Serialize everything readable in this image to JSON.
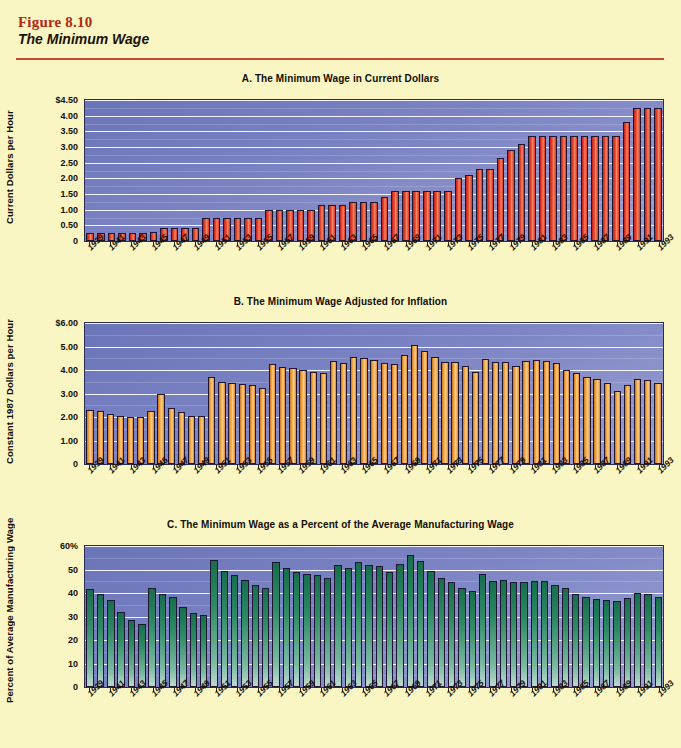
{
  "figure": {
    "number": "Figure 8.10",
    "title": "The Minimum Wage"
  },
  "colors": {
    "page_background": "#f9f6c4",
    "rule": "#c8482e",
    "figure_number": "#b02a14",
    "plot_background_top": "#6a74b8",
    "plot_background_bottom": "#9aa0d2",
    "bar_a": "#ea4a2b",
    "bar_b": "#f0a23f",
    "bar_c": "#2d8a63",
    "gridline": "#ffffff"
  },
  "panels": [
    {
      "key": "A",
      "title": "A.  The Minimum Wage in Current Dollars",
      "ylabel": "Current Dollars per Hour",
      "bar_class": "red",
      "yticks": [
        "$4.50",
        "4.00",
        "3.50",
        "3.00",
        "2.50",
        "2.00",
        "1.50",
        "1.00",
        "0.50",
        "0"
      ]
    },
    {
      "key": "B",
      "title": "B.  The Minimum Wage Adjusted for Inflation",
      "ylabel": "Constant 1987 Dollars per Hour",
      "bar_class": "orange",
      "yticks": [
        "$6.00",
        "5.00",
        "4.00",
        "3.00",
        "2.00",
        "1.00",
        "0"
      ]
    },
    {
      "key": "C",
      "title": "C.  The Minimum Wage as a Percent of the Average Manufacturing Wage",
      "ylabel": "Percent of Average Manufacturing Wage",
      "bar_class": "green",
      "yticks": [
        "60%",
        "50",
        "40",
        "30",
        "20",
        "10",
        "0"
      ]
    }
  ],
  "xaxis": {
    "all_years": [
      1939,
      1940,
      1941,
      1942,
      1943,
      1944,
      1945,
      1946,
      1947,
      1948,
      1949,
      1950,
      1951,
      1952,
      1953,
      1954,
      1955,
      1956,
      1957,
      1958,
      1959,
      1960,
      1961,
      1962,
      1963,
      1964,
      1965,
      1966,
      1967,
      1968,
      1969,
      1970,
      1971,
      1972,
      1973,
      1974,
      1975,
      1976,
      1977,
      1978,
      1979,
      1980,
      1981,
      1982,
      1983,
      1984,
      1985,
      1986,
      1987,
      1988,
      1989,
      1990,
      1991,
      1992,
      1993
    ],
    "labeled_years": [
      1939,
      1941,
      1943,
      1945,
      1947,
      1949,
      1951,
      1953,
      1955,
      1957,
      1959,
      1961,
      1963,
      1965,
      1967,
      1969,
      1971,
      1973,
      1975,
      1977,
      1979,
      1981,
      1983,
      1985,
      1987,
      1989,
      1991,
      1993
    ]
  },
  "chart_data": [
    {
      "type": "bar",
      "title": "A.  The Minimum Wage in Current Dollars",
      "xlabel": "",
      "ylabel": "Current Dollars per Hour",
      "ylim": [
        0,
        4.5
      ],
      "grid": true,
      "legend": "none",
      "categories": [
        1939,
        1940,
        1941,
        1942,
        1943,
        1944,
        1945,
        1946,
        1947,
        1948,
        1949,
        1950,
        1951,
        1952,
        1953,
        1954,
        1955,
        1956,
        1957,
        1958,
        1959,
        1960,
        1961,
        1962,
        1963,
        1964,
        1965,
        1966,
        1967,
        1968,
        1969,
        1970,
        1971,
        1972,
        1973,
        1974,
        1975,
        1976,
        1977,
        1978,
        1979,
        1980,
        1981,
        1982,
        1983,
        1984,
        1985,
        1986,
        1987,
        1988,
        1989,
        1990,
        1991,
        1992,
        1993
      ],
      "values": [
        0.25,
        0.25,
        0.25,
        0.25,
        0.25,
        0.25,
        0.3,
        0.4,
        0.4,
        0.4,
        0.4,
        0.75,
        0.75,
        0.75,
        0.75,
        0.75,
        0.75,
        1.0,
        1.0,
        1.0,
        1.0,
        1.0,
        1.15,
        1.15,
        1.15,
        1.25,
        1.25,
        1.25,
        1.4,
        1.6,
        1.6,
        1.6,
        1.6,
        1.6,
        1.6,
        2.0,
        2.1,
        2.3,
        2.3,
        2.65,
        2.9,
        3.1,
        3.35,
        3.35,
        3.35,
        3.35,
        3.35,
        3.35,
        3.35,
        3.35,
        3.35,
        3.8,
        4.25,
        4.25,
        4.25
      ]
    },
    {
      "type": "bar",
      "title": "B.  The Minimum Wage Adjusted for Inflation",
      "xlabel": "",
      "ylabel": "Constant 1987 Dollars per Hour",
      "ylim": [
        0,
        6.0
      ],
      "grid": true,
      "legend": "none",
      "categories": [
        1939,
        1940,
        1941,
        1942,
        1943,
        1944,
        1945,
        1946,
        1947,
        1948,
        1949,
        1950,
        1951,
        1952,
        1953,
        1954,
        1955,
        1956,
        1957,
        1958,
        1959,
        1960,
        1961,
        1962,
        1963,
        1964,
        1965,
        1966,
        1967,
        1968,
        1969,
        1970,
        1971,
        1972,
        1973,
        1974,
        1975,
        1976,
        1977,
        1978,
        1979,
        1980,
        1981,
        1982,
        1983,
        1984,
        1985,
        1986,
        1987,
        1988,
        1989,
        1990,
        1991,
        1992,
        1993
      ],
      "values": [
        2.3,
        2.27,
        2.14,
        2.05,
        2.0,
        1.98,
        2.25,
        3.0,
        2.4,
        2.2,
        2.05,
        2.06,
        3.7,
        3.5,
        3.45,
        3.4,
        3.35,
        3.25,
        4.25,
        4.12,
        4.08,
        4.0,
        3.92,
        3.88,
        4.38,
        4.3,
        4.55,
        4.52,
        4.42,
        4.3,
        4.25,
        4.62,
        5.05,
        4.8,
        4.55,
        4.35,
        4.32,
        4.15,
        3.92,
        4.45,
        4.35,
        4.32,
        4.18,
        4.4,
        4.42,
        4.4,
        4.28,
        4.02,
        3.88,
        3.72,
        3.6,
        3.45,
        3.1,
        3.38,
        3.62,
        3.58,
        3.45
      ]
    },
    {
      "type": "bar",
      "title": "C.  The Minimum Wage as a Percent of the Average Manufacturing Wage",
      "xlabel": "",
      "ylabel": "Percent of Average Manufacturing Wage",
      "ylim": [
        0,
        60
      ],
      "grid": true,
      "legend": "none",
      "categories": [
        1939,
        1940,
        1941,
        1942,
        1943,
        1944,
        1945,
        1946,
        1947,
        1948,
        1949,
        1950,
        1951,
        1952,
        1953,
        1954,
        1955,
        1956,
        1957,
        1958,
        1959,
        1960,
        1961,
        1962,
        1963,
        1964,
        1965,
        1966,
        1967,
        1968,
        1969,
        1970,
        1971,
        1972,
        1973,
        1974,
        1975,
        1976,
        1977,
        1978,
        1979,
        1980,
        1981,
        1982,
        1983,
        1984,
        1985,
        1986,
        1987,
        1988,
        1989,
        1990,
        1991,
        1992,
        1993
      ],
      "values": [
        41.5,
        39.5,
        37.0,
        32.0,
        28.5,
        27.0,
        42.0,
        39.5,
        38.5,
        34.0,
        31.5,
        30.5,
        54.0,
        49.5,
        47.5,
        45.5,
        43.5,
        42.0,
        53.0,
        50.5,
        49.0,
        48.0,
        47.5,
        46.5,
        52.0,
        50.5,
        53.0,
        52.0,
        51.5,
        49.0,
        52.5,
        56.0,
        53.5,
        49.5,
        46.5,
        44.5,
        42.0,
        41.0,
        48.0,
        45.0,
        45.5,
        44.5,
        44.5,
        45.0,
        45.0,
        43.5,
        42.0,
        39.5,
        38.5,
        37.5,
        37.0,
        36.5,
        38.0,
        40.0,
        39.5,
        38.5
      ]
    }
  ]
}
